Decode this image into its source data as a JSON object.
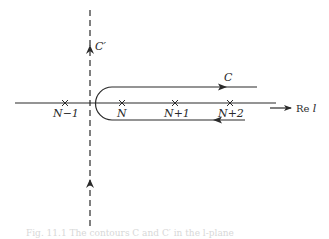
{
  "diagram": {
    "type": "contour-diagram",
    "axis": {
      "label_prefix": "Re",
      "label_var": "l"
    },
    "poles": [
      {
        "label": "N−1",
        "x": 65
      },
      {
        "label": "N",
        "x": 122
      },
      {
        "label": "N+1",
        "x": 175
      },
      {
        "label": "N+2",
        "x": 230
      }
    ],
    "contours": [
      {
        "name": "C",
        "label": "C",
        "shape": "hairpin around poles N, N+1, N+2"
      },
      {
        "name": "C'",
        "label": "C′",
        "shape": "vertical dashed line between N−1 and N"
      }
    ],
    "caption": "Fig. 11.1  The contours C and C′ in the l-plane"
  },
  "colors": {
    "ink": "#2a2a2a",
    "background": "#ffffff"
  }
}
